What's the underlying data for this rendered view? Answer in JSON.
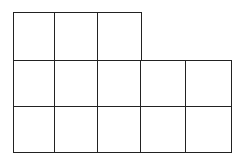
{
  "diagram": {
    "type": "unit-square-grid",
    "line_color": "#222222",
    "background": "#ffffff",
    "rows": [
      {
        "count": 3
      },
      {
        "count": 5
      },
      {
        "count": 5
      }
    ],
    "total_squares": 13,
    "grid": {
      "origin_x": 13,
      "origin_y": 12,
      "col_edges": [
        13,
        54,
        97,
        140,
        185,
        230
      ],
      "row_edges": [
        12,
        60,
        106,
        151
      ]
    }
  }
}
